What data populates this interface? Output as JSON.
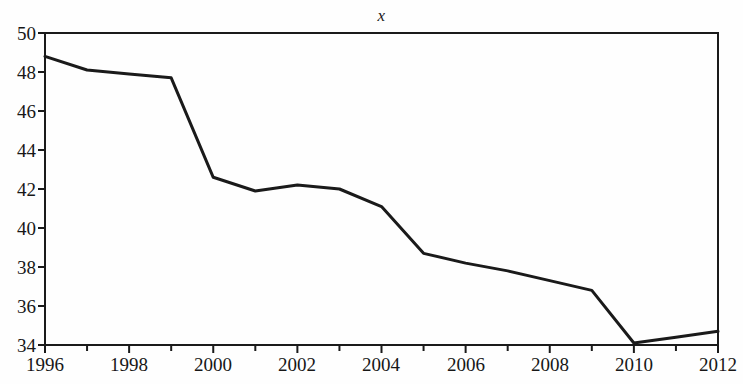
{
  "chart_data": {
    "type": "line",
    "title": "x",
    "xlabel": "",
    "ylabel": "",
    "x": [
      1996,
      1997,
      1998,
      1999,
      2000,
      2001,
      2002,
      2003,
      2004,
      2005,
      2006,
      2007,
      2008,
      2009,
      2010,
      2011,
      2012
    ],
    "values": [
      48.8,
      48.1,
      47.9,
      47.7,
      42.6,
      41.9,
      42.2,
      42.0,
      41.1,
      38.7,
      38.2,
      37.8,
      37.3,
      36.8,
      34.1,
      34.4,
      34.7
    ],
    "series": [
      {
        "name": "x",
        "values": [
          48.8,
          48.1,
          47.9,
          47.7,
          42.6,
          41.9,
          42.2,
          42.0,
          41.1,
          38.7,
          38.2,
          37.8,
          37.3,
          36.8,
          34.1,
          34.4,
          34.7
        ]
      }
    ],
    "xlim": [
      1996,
      2012
    ],
    "ylim": [
      34,
      50
    ],
    "y_ticks": [
      34,
      36,
      38,
      40,
      42,
      44,
      46,
      48,
      50
    ],
    "y_tick_labels": [
      "34",
      "36",
      "38",
      "40",
      "42",
      "44",
      "46",
      "48",
      "50"
    ],
    "x_ticks": [
      1996,
      1997,
      1998,
      1999,
      2000,
      2001,
      2002,
      2003,
      2004,
      2005,
      2006,
      2007,
      2008,
      2009,
      2010,
      2011,
      2012
    ],
    "x_tick_labels_shown": [
      "1996",
      "1998",
      "2000",
      "2002",
      "2004",
      "2006",
      "2008",
      "2010",
      "2012"
    ],
    "x_minor_ticks_unlabeled": [
      1997,
      1999,
      2001,
      2003,
      2005,
      2007,
      2009,
      2011
    ],
    "grid": false,
    "legend": false,
    "line_color": "#1a1a1a",
    "line_width": 3,
    "frame_color": "#1a1a1a",
    "background_color": "#fefefe"
  },
  "axis": {
    "y_labels": [
      "50",
      "48",
      "46",
      "44",
      "42",
      "40",
      "38",
      "36",
      "34"
    ],
    "x_labels": [
      "1996",
      "1998",
      "2000",
      "2002",
      "2004",
      "2006",
      "2008",
      "2010",
      "2012"
    ]
  }
}
